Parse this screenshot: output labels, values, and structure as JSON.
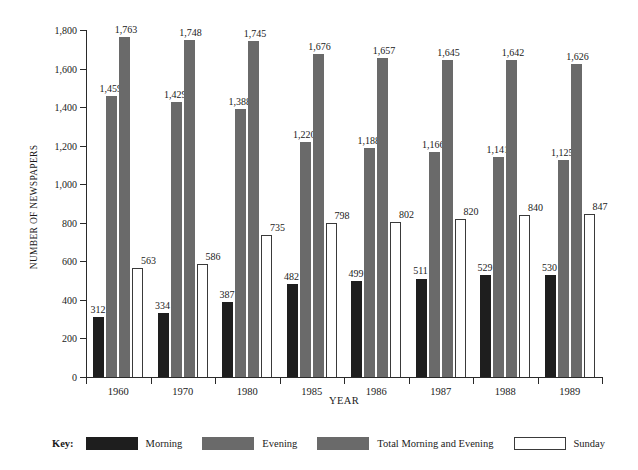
{
  "chart_data": {
    "type": "bar",
    "title": "",
    "xlabel": "YEAR",
    "ylabel": "NUMBER OF NEWSPAPERS",
    "ylim": [
      0,
      1800
    ],
    "ytick_step": 200,
    "grid": false,
    "legend_position": "bottom",
    "categories": [
      "1960",
      "1970",
      "1980",
      "1985",
      "1986",
      "1987",
      "1988",
      "1989"
    ],
    "ytick_labels": [
      "0",
      "200",
      "400",
      "600",
      "800",
      "1,000",
      "1,200",
      "1,400",
      "1,600",
      "1,800"
    ],
    "ytick_values": [
      0,
      200,
      400,
      600,
      800,
      1000,
      1200,
      1400,
      1600,
      1800
    ],
    "series": [
      {
        "name": "Morning",
        "color": "#1e1e1e",
        "values": [
          312,
          334,
          387,
          482,
          499,
          511,
          529,
          530
        ],
        "labels": [
          "312",
          "334",
          "387",
          "482",
          "499",
          "511",
          "529",
          "530"
        ]
      },
      {
        "name": "Evening",
        "color": "#6a6a6a",
        "values": [
          1459,
          1429,
          1388,
          1220,
          1188,
          1166,
          1141,
          1125
        ],
        "labels": [
          "1,459",
          "1,429",
          "1,388",
          "1,220",
          "1,188",
          "1,166",
          "1,141",
          "1,125"
        ]
      },
      {
        "name": "Total Morning and Evening",
        "color": "#6a6a6a",
        "values": [
          1763,
          1748,
          1745,
          1676,
          1657,
          1645,
          1642,
          1626
        ],
        "labels": [
          "1,763",
          "1,748",
          "1,745",
          "1,676",
          "1,657",
          "1,645",
          "1,642",
          "1,626"
        ]
      },
      {
        "name": "Sunday",
        "color": "#ffffff",
        "values": [
          563,
          586,
          735,
          798,
          802,
          820,
          840,
          847
        ],
        "labels": [
          "563",
          "586",
          "735",
          "798",
          "802",
          "820",
          "840",
          "847"
        ]
      }
    ]
  },
  "legend": {
    "key_label": "Key:",
    "items": [
      {
        "label": "Morning",
        "swatch": "morning"
      },
      {
        "label": "Evening",
        "swatch": "evening"
      },
      {
        "label": "Total Morning and Evening",
        "swatch": "total"
      },
      {
        "label": "Sunday",
        "swatch": "sunday"
      }
    ]
  }
}
